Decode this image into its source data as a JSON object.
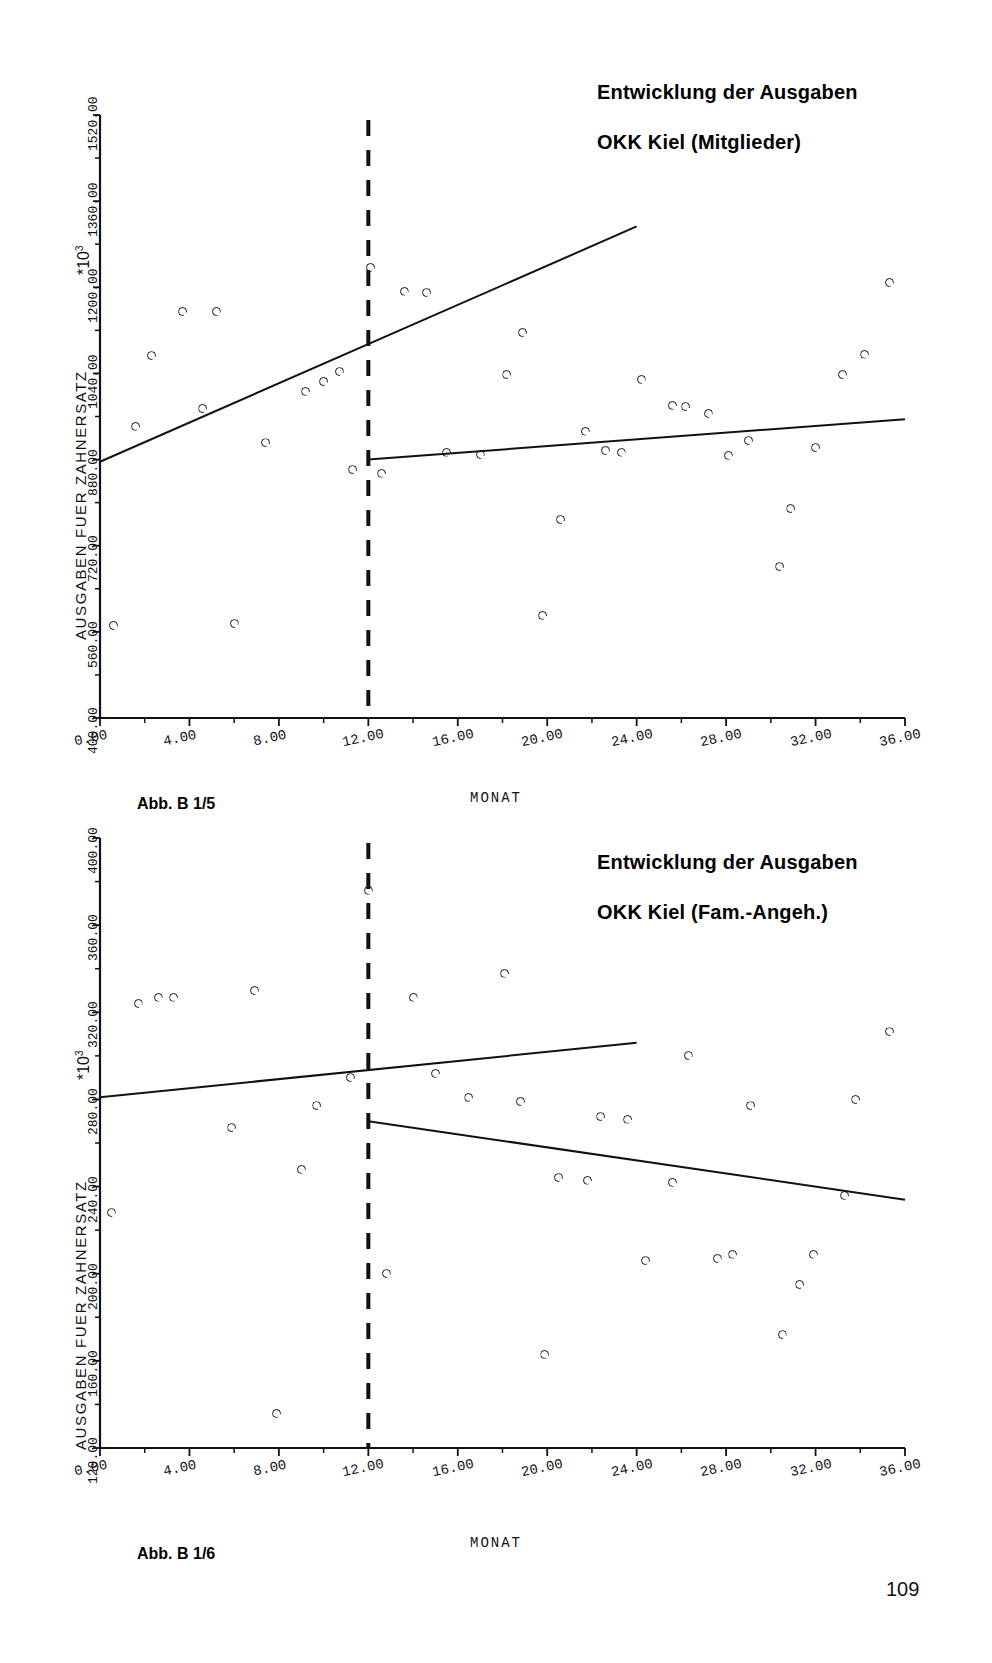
{
  "page": {
    "number": "109"
  },
  "charts": [
    {
      "id": "chart-mitglieder",
      "title_line1": "Entwicklung der Ausgaben",
      "title_line2": "OKK Kiel (Mitglieder)",
      "caption": "Abb. B 1/5",
      "multiplier": "*10",
      "multiplier_exp": "3",
      "chart_data": {
        "type": "scatter",
        "title": "Entwicklung der Ausgaben OKK Kiel (Mitglieder)",
        "xlabel": "MONAT",
        "ylabel": "AUSGABEN FUER ZAHNERSATZ",
        "y_multiplier": "*10^3",
        "grid": false,
        "legend": "none",
        "xlim": [
          0,
          36
        ],
        "ylim": [
          400,
          1520
        ],
        "xticks": [
          "0.00",
          "4.00",
          "8.00",
          "12.00",
          "16.00",
          "20.00",
          "24.00",
          "28.00",
          "32.00",
          "36.00"
        ],
        "xtick_values": [
          0,
          4,
          8,
          12,
          16,
          20,
          24,
          28,
          32,
          36
        ],
        "yticks": [
          "400.00",
          "560.00",
          "720.00",
          "880.00",
          "1040.00",
          "1200.00",
          "1360.00",
          "1520.00"
        ],
        "ytick_values": [
          400,
          560,
          720,
          880,
          1040,
          1200,
          1360,
          1520
        ],
        "intervention_month": 12,
        "points": [
          {
            "x": 0.6,
            "y": 572
          },
          {
            "x": 1.6,
            "y": 942
          },
          {
            "x": 2.3,
            "y": 1073
          },
          {
            "x": 3.7,
            "y": 1155
          },
          {
            "x": 4.6,
            "y": 975
          },
          {
            "x": 5.2,
            "y": 1155
          },
          {
            "x": 6.0,
            "y": 575
          },
          {
            "x": 7.4,
            "y": 911
          },
          {
            "x": 9.2,
            "y": 1007
          },
          {
            "x": 10.0,
            "y": 1025
          },
          {
            "x": 10.7,
            "y": 1043
          },
          {
            "x": 11.3,
            "y": 861
          },
          {
            "x": 12.1,
            "y": 1237
          },
          {
            "x": 12.6,
            "y": 855
          },
          {
            "x": 13.6,
            "y": 1193
          },
          {
            "x": 14.6,
            "y": 1190
          },
          {
            "x": 15.5,
            "y": 894
          },
          {
            "x": 17.0,
            "y": 889
          },
          {
            "x": 18.2,
            "y": 1038
          },
          {
            "x": 18.9,
            "y": 1116
          },
          {
            "x": 19.8,
            "y": 591
          },
          {
            "x": 20.6,
            "y": 768
          },
          {
            "x": 21.7,
            "y": 933
          },
          {
            "x": 22.6,
            "y": 897
          },
          {
            "x": 23.3,
            "y": 894
          },
          {
            "x": 24.2,
            "y": 1029
          },
          {
            "x": 25.6,
            "y": 981
          },
          {
            "x": 26.2,
            "y": 978
          },
          {
            "x": 27.2,
            "y": 966
          },
          {
            "x": 28.1,
            "y": 888
          },
          {
            "x": 29.0,
            "y": 915
          },
          {
            "x": 30.4,
            "y": 681
          },
          {
            "x": 30.9,
            "y": 789
          },
          {
            "x": 32.0,
            "y": 902
          },
          {
            "x": 33.2,
            "y": 1038
          },
          {
            "x": 34.2,
            "y": 1076
          },
          {
            "x": 35.3,
            "y": 1209
          }
        ],
        "trend_lines": [
          {
            "name": "pre-intervention",
            "x0": 0,
            "y0": 876,
            "x1": 24,
            "y1": 1313
          },
          {
            "name": "post-intervention",
            "x0": 12,
            "y0": 880,
            "x1": 36,
            "y1": 955
          }
        ]
      }
    },
    {
      "id": "chart-fam-angeh",
      "title_line1": "Entwicklung der Ausgaben",
      "title_line2": "OKK Kiel (Fam.-Angeh.)",
      "caption": "Abb. B 1/6",
      "multiplier": "*10",
      "multiplier_exp": "3",
      "chart_data": {
        "type": "scatter",
        "title": "Entwicklung der Ausgaben OKK Kiel (Fam.-Angeh.)",
        "xlabel": "MONAT",
        "ylabel": "AUSGABEN FUER ZAHNERSATZ",
        "y_multiplier": "*10^3",
        "grid": false,
        "legend": "none",
        "xlim": [
          0,
          36
        ],
        "ylim": [
          120,
          400
        ],
        "xticks": [
          "0.00",
          "4.00",
          "8.00",
          "12.00",
          "16.00",
          "20.00",
          "24.00",
          "28.00",
          "32.00",
          "36.00"
        ],
        "xtick_values": [
          0,
          4,
          8,
          12,
          16,
          20,
          24,
          28,
          32,
          36
        ],
        "yticks": [
          "120.00",
          "160.00",
          "200.00",
          "240.00",
          "280.00",
          "320.00",
          "360.00",
          "400.00"
        ],
        "ytick_values": [
          120,
          160,
          200,
          240,
          280,
          320,
          360,
          400
        ],
        "intervention_month": 12,
        "points": [
          {
            "x": 0.5,
            "y": 228
          },
          {
            "x": 1.7,
            "y": 324
          },
          {
            "x": 2.6,
            "y": 327
          },
          {
            "x": 3.3,
            "y": 327
          },
          {
            "x": 5.9,
            "y": 267
          },
          {
            "x": 6.9,
            "y": 330
          },
          {
            "x": 7.9,
            "y": 136
          },
          {
            "x": 9.0,
            "y": 248
          },
          {
            "x": 9.7,
            "y": 277
          },
          {
            "x": 11.2,
            "y": 290
          },
          {
            "x": 12.0,
            "y": 376
          },
          {
            "x": 12.8,
            "y": 200
          },
          {
            "x": 14.0,
            "y": 327
          },
          {
            "x": 15.0,
            "y": 292
          },
          {
            "x": 16.5,
            "y": 281
          },
          {
            "x": 18.1,
            "y": 338
          },
          {
            "x": 18.8,
            "y": 279
          },
          {
            "x": 19.9,
            "y": 163
          },
          {
            "x": 20.5,
            "y": 244
          },
          {
            "x": 21.8,
            "y": 243
          },
          {
            "x": 22.4,
            "y": 272
          },
          {
            "x": 23.6,
            "y": 271
          },
          {
            "x": 24.4,
            "y": 206
          },
          {
            "x": 25.6,
            "y": 242
          },
          {
            "x": 26.3,
            "y": 300
          },
          {
            "x": 27.6,
            "y": 207
          },
          {
            "x": 28.3,
            "y": 209
          },
          {
            "x": 29.1,
            "y": 277
          },
          {
            "x": 30.5,
            "y": 172
          },
          {
            "x": 31.3,
            "y": 195
          },
          {
            "x": 31.9,
            "y": 209
          },
          {
            "x": 33.3,
            "y": 236
          },
          {
            "x": 33.8,
            "y": 280
          },
          {
            "x": 35.3,
            "y": 311
          }
        ],
        "trend_lines": [
          {
            "name": "pre-intervention",
            "x0": 0,
            "y0": 281,
            "x1": 24,
            "y1": 306
          },
          {
            "name": "post-intervention",
            "x0": 12,
            "y0": 270,
            "x1": 36,
            "y1": 234
          }
        ]
      }
    }
  ]
}
